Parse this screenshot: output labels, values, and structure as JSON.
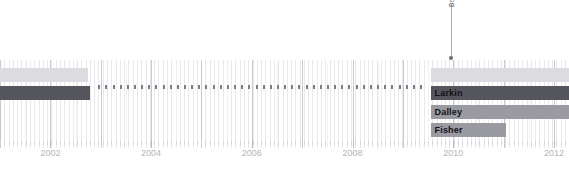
{
  "chart_data": {
    "type": "bar",
    "title": "",
    "subtitle": "",
    "xlabel": "",
    "ylabel": "",
    "orientation": "horizontal-timeline",
    "grid": true,
    "legend_position": "none",
    "xlim": [
      2001.0,
      2012.3
    ],
    "xticks": [
      2002,
      2004,
      2006,
      2008,
      2010,
      2012
    ],
    "xtick_labels": [
      "2002",
      "2004",
      "2006",
      "2008",
      "2010",
      "2012"
    ],
    "categories": [
      "",
      "Larkin",
      "Dalley",
      "Fisher"
    ],
    "series": [
      {
        "name": "row-1",
        "label": "",
        "color": "#dcdce0",
        "segments": [
          {
            "start": 2001.0,
            "end": 2002.75,
            "color": "#dcdce0"
          },
          {
            "start": 2009.55,
            "end": 2012.3,
            "color": "#dcdce0"
          }
        ]
      },
      {
        "name": "row-2",
        "label": "Larkin",
        "color": "#55555d",
        "segments": [
          {
            "start": 2001.0,
            "end": 2002.78,
            "color": "#55555d"
          },
          {
            "start": 2009.55,
            "end": 2012.3,
            "color": "#55555d"
          }
        ]
      },
      {
        "name": "row-3",
        "label": "Dalley",
        "color": "#9a9aa2",
        "segments": [
          {
            "start": 2009.55,
            "end": 2012.3,
            "color": "#9a9aa2"
          }
        ]
      },
      {
        "name": "row-4",
        "label": "Fisher",
        "color": "#9a9aa2",
        "segments": [
          {
            "start": 2009.55,
            "end": 2011.05,
            "color": "#9a9aa2"
          }
        ]
      }
    ],
    "annotations": [
      {
        "text": "Bobby Dazzler",
        "x": 2009.95,
        "marker": "dot",
        "orientation": "vertical"
      }
    ]
  },
  "labels": {
    "row1": "",
    "row2": "Larkin",
    "row3": "Dalley",
    "row4": "Fisher"
  },
  "annotation": {
    "text": "Bobby Dazzler"
  },
  "axis": {
    "t0": "2002",
    "t1": "2004",
    "t2": "2006",
    "t3": "2008",
    "t4": "2010",
    "t5": "2012"
  },
  "colors": {
    "light": "#dcdce0",
    "mid": "#9a9aa2",
    "dark": "#55555d",
    "grid_minor": "#e9e9ec",
    "grid_major": "#c9c9cf",
    "axis_text": "#b4b4bb"
  }
}
